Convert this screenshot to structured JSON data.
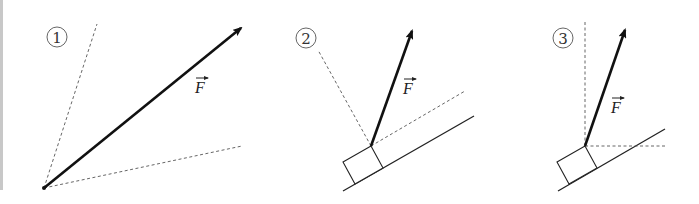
{
  "figure": {
    "colors": {
      "stroke": "#111111",
      "dashed": "#555555",
      "shade_dark": "#8a8a8a",
      "background": "#ffffff",
      "edge_bar": "#c8c8c8"
    }
  },
  "panels": [
    {
      "id": "1",
      "number_label": "1",
      "force_label": "F",
      "origin": [
        44,
        188
      ],
      "arrow_tip": [
        241,
        28
      ],
      "dashed_lines": [
        {
          "from": [
            44,
            188
          ],
          "to": [
            97,
            24
          ]
        },
        {
          "from": [
            44,
            188
          ],
          "to": [
            242,
            146
          ]
        }
      ],
      "label_pos": [
        195,
        93
      ],
      "circle_pos": [
        57,
        37
      ],
      "has_incline": false
    },
    {
      "id": "2",
      "number_label": "2",
      "force_label": "F",
      "origin": [
        371,
        146
      ],
      "arrow_tip": [
        412,
        31
      ],
      "dashed_lines": [
        {
          "from": [
            371,
            146
          ],
          "to": [
            318,
            50
          ]
        },
        {
          "from": [
            371,
            146
          ],
          "to": [
            465,
            91
          ]
        }
      ],
      "block": [
        [
          343,
          162
        ],
        [
          371,
          146
        ],
        [
          383,
          168
        ],
        [
          355,
          184
        ]
      ],
      "incline": {
        "from": [
          343,
          191
        ],
        "to": [
          474,
          116
        ]
      },
      "label_pos": [
        403,
        94
      ],
      "circle_pos": [
        306,
        38
      ],
      "has_incline": true
    },
    {
      "id": "3",
      "number_label": "3",
      "force_label": "F",
      "origin": [
        585,
        146
      ],
      "arrow_tip": [
        625,
        30
      ],
      "dashed_lines": [
        {
          "from": [
            585,
            146
          ],
          "to": [
            585,
            22
          ]
        },
        {
          "from": [
            585,
            146
          ],
          "to": [
            665,
            146
          ]
        }
      ],
      "block": [
        [
          557,
          162
        ],
        [
          585,
          146
        ],
        [
          597,
          168
        ],
        [
          569,
          184
        ]
      ],
      "incline": {
        "from": [
          558,
          191
        ],
        "to": [
          665,
          129
        ]
      },
      "label_pos": [
        611,
        113
      ],
      "circle_pos": [
        563,
        38
      ],
      "has_incline": true
    }
  ]
}
